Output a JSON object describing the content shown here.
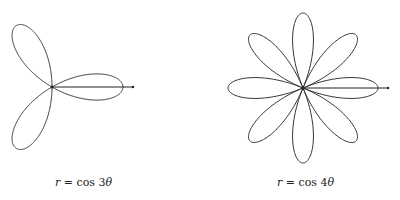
{
  "figures": [
    {
      "id": "rose3",
      "equation": "r = cos 3θ",
      "k": 3,
      "label_var": "r",
      "label_rest": " = cos 3",
      "label_theta": "θ"
    },
    {
      "id": "rose4",
      "equation": "r = cos 4θ",
      "k": 4,
      "label_var": "r",
      "label_rest": " = cos 4",
      "label_theta": "θ"
    }
  ],
  "colors": {
    "curve": "#333333",
    "background": "#ffffff"
  }
}
